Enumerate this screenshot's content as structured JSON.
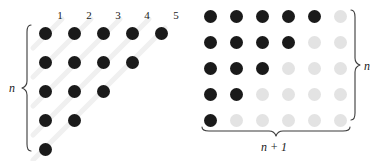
{
  "figure": {
    "left_diagram": {
      "name": "staircase-triangle",
      "column_labels": [
        "1",
        "2",
        "3",
        "4",
        "5"
      ],
      "row_counts": [
        5,
        4,
        3,
        2,
        1
      ],
      "brace_label": "n",
      "dot_color_dark": "#1a1a1a",
      "stripe_color": "#f0f0f0"
    },
    "right_diagram": {
      "name": "rectangle-grid",
      "rows": 5,
      "columns": 6,
      "dark_row_counts": [
        5,
        4,
        3,
        2,
        1
      ],
      "right_brace_label": "n",
      "bottom_brace_label": "n + 1",
      "dot_color_dark": "#1a1a1a",
      "dot_color_light": "#e3e3e3"
    }
  }
}
